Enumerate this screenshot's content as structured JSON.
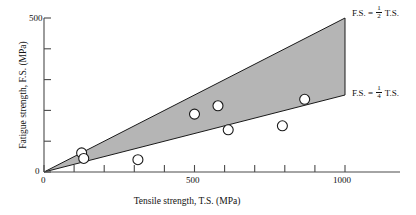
{
  "chart_data": {
    "type": "scatter",
    "title": "",
    "xlabel": "Tensile strength, T.S. (MPa)",
    "ylabel": "Fatigue strength, F.S. (MPa)",
    "xlim": [
      0,
      1000
    ],
    "ylim": [
      0,
      500
    ],
    "x_ticks": [
      0,
      100,
      200,
      300,
      400,
      500,
      600,
      700,
      800,
      900,
      1000
    ],
    "x_tick_labels": [
      "0",
      "",
      "",
      "",
      "",
      "500",
      "",
      "",
      "",
      "",
      "1000"
    ],
    "y_ticks": [
      0,
      100,
      200,
      300,
      400,
      500
    ],
    "y_tick_labels": [
      "0",
      "",
      "",
      "",
      "",
      "500"
    ],
    "grid": false,
    "legend_position": "inline-right",
    "points": [
      {
        "x": 125,
        "y": 62
      },
      {
        "x": 132,
        "y": 44
      },
      {
        "x": 312,
        "y": 40
      },
      {
        "x": 500,
        "y": 188
      },
      {
        "x": 578,
        "y": 215
      },
      {
        "x": 612,
        "y": 137
      },
      {
        "x": 792,
        "y": 150
      },
      {
        "x": 866,
        "y": 236
      }
    ],
    "bands": [
      {
        "name": "design-band",
        "upper_slope": 0.5,
        "lower_slope": 0.25,
        "x_start": 0,
        "x_end": 1000,
        "fill": "#b5b5b5"
      }
    ],
    "annotations": [
      {
        "id": "upper-bound",
        "prefix": "F.S. =",
        "numerator": "1",
        "denominator": "2",
        "suffix": "T.S.",
        "slope": 0.5
      },
      {
        "id": "lower-bound",
        "prefix": "F.S. =",
        "numerator": "1",
        "denominator": "4",
        "suffix": "T.S.",
        "slope": 0.25
      }
    ],
    "marker": {
      "shape": "circle-open",
      "face_color": "#ffffff",
      "edge_color": "#1a1a1a",
      "radius_px": 5
    },
    "axis_color": "#4a4a4a"
  },
  "ticks": {
    "x_zero": "0",
    "x_mid": "500",
    "x_max": "1000",
    "y_zero": "0",
    "y_max": "500"
  }
}
